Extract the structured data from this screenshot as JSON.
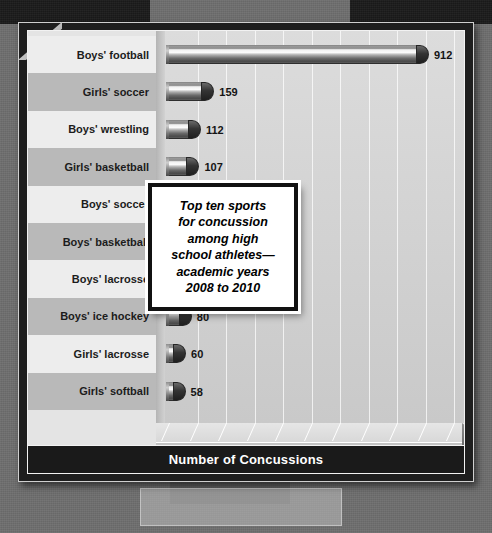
{
  "chart_data": {
    "type": "bar",
    "orientation": "horizontal",
    "xlabel": "Number of Concussions",
    "ylabel": "",
    "xlim": [
      0,
      1000
    ],
    "grid": true,
    "legend": "none",
    "categories": [
      "Boys' football",
      "Girls' soccer",
      "Boys' wrestling",
      "Girls' basketball",
      "Boys' soccer",
      "Boys' basketball",
      "Boys' lacrosse",
      "Boys' ice hockey",
      "Girls' lacrosse",
      "Girls' softball"
    ],
    "values": [
      912,
      159,
      112,
      107,
      103,
      96,
      93,
      80,
      60,
      58
    ],
    "value_labels": [
      "912",
      "159",
      "112",
      "107",
      "103",
      "96",
      "93",
      "80",
      "60",
      "58"
    ],
    "xticks": [
      0,
      100,
      200,
      300,
      400,
      500,
      600,
      700,
      800,
      900,
      1000
    ],
    "xtick_labels": [
      "0",
      "100",
      "200",
      "300",
      "400",
      "500",
      "600",
      "700",
      "800",
      "900",
      "1,000"
    ]
  },
  "callout": {
    "lines": [
      "Top ten sports",
      "for concussion",
      "among high",
      "school athletes—",
      "academic years",
      "2008 to 2010"
    ]
  },
  "axis": {
    "title": "Number of Concussions"
  },
  "colors": {
    "backdrop": "#3a3a3a",
    "plot_bg": "#d2d2d2",
    "bar_dark": "#4a4a4a",
    "bar_light": "#fbfbfb",
    "band_light": "#ededed",
    "band_dark": "#b9b9b9",
    "title_band": "#1a1a1a",
    "text": "#141414"
  }
}
